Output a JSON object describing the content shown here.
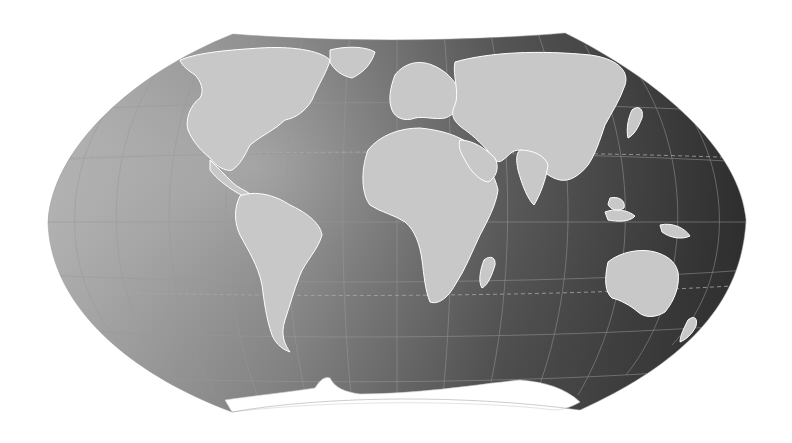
{
  "map": {
    "title": "",
    "projection": "winkel-tripel-like",
    "style": "grayscale",
    "colors": {
      "background": "#ffffff",
      "ocean_left": "#b4b4b4",
      "ocean_mid": "#7a7a7a",
      "ocean_right": "#3a3a3a",
      "land": "#c9c9c9",
      "borders": "#ffffff",
      "graticule": "#8e8e8e",
      "antarctica": "#ffffff"
    },
    "features": {
      "graticule": true,
      "tropics_dashed": true,
      "country_borders": true,
      "labels": false
    },
    "regions": [
      "North America",
      "South America",
      "Greenland",
      "Europe",
      "Africa",
      "Asia",
      "Australia",
      "Antarctica",
      "Madagascar",
      "New Zealand",
      "Japan",
      "Indonesia"
    ]
  }
}
